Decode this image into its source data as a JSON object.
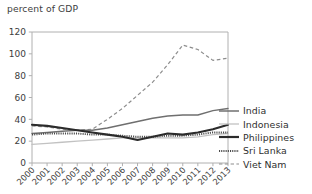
{
  "chart_data": {
    "type": "line",
    "title": "percent of GDP",
    "ylabel": "percent of GDP",
    "xlabel": "",
    "grid": false,
    "legend_position": "right",
    "ylim": [
      0,
      120
    ],
    "yticks": [
      0,
      20,
      40,
      60,
      80,
      100,
      120
    ],
    "categories": [
      "2000",
      "2001",
      "2002",
      "2003",
      "2004",
      "2005",
      "2006",
      "2007",
      "2008",
      "2009",
      "2010",
      "2011",
      "2012",
      "2013"
    ],
    "x": [
      2000,
      2001,
      2002,
      2003,
      2004,
      2005,
      2006,
      2007,
      2008,
      2009,
      2010,
      2011,
      2012,
      2013
    ],
    "series": [
      {
        "name": "India",
        "style": "solid",
        "color": "#6f6f6f",
        "values": [
          27,
          28,
          29,
          30,
          30,
          32,
          35,
          38,
          41,
          43,
          44,
          44,
          48,
          50
        ]
      },
      {
        "name": "Indonesia",
        "style": "solid-thin",
        "color": "#c2c2c2",
        "values": [
          17,
          18,
          19,
          20,
          21,
          22,
          23,
          23,
          23,
          23,
          23,
          24,
          26,
          27
        ]
      },
      {
        "name": "Philippines",
        "style": "solid-thick",
        "color": "#2b2b2b",
        "values": [
          35,
          34,
          32,
          30,
          28,
          26,
          24,
          21,
          24,
          27,
          26,
          28,
          31,
          35
        ]
      },
      {
        "name": "Sri Lanka",
        "style": "dotted",
        "color": "#4a4a4a",
        "values": [
          26,
          27,
          27,
          27,
          26,
          26,
          25,
          24,
          24,
          25,
          25,
          26,
          28,
          28
        ]
      },
      {
        "name": "Viet Nam",
        "style": "dashed",
        "color": "#8d8d8d",
        "values": [
          34,
          33,
          31,
          30,
          31,
          40,
          50,
          62,
          74,
          90,
          108,
          104,
          94,
          96
        ]
      }
    ]
  },
  "legend": {
    "items": [
      {
        "label": "India"
      },
      {
        "label": "Indonesia"
      },
      {
        "label": "Philippines"
      },
      {
        "label": "Sri Lanka"
      },
      {
        "label": "Viet Nam"
      }
    ]
  }
}
